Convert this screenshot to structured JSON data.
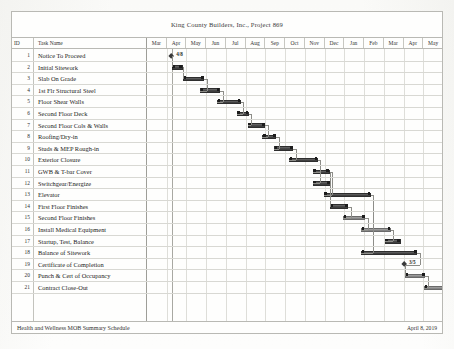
{
  "document": {
    "title": "King County Builders, Inc., Project 869",
    "footer_left": "Health and Wellness MOB Summary Schedule",
    "footer_right": "April 8, 2019"
  },
  "columns": {
    "id_header": "ID",
    "task_header": "Task Name"
  },
  "timeline": {
    "months": [
      "Mar",
      "Apr",
      "May",
      "Jun",
      "Jul",
      "Aug",
      "Sep",
      "Oct",
      "Nov",
      "Dec",
      "Jan",
      "Feb",
      "Mar",
      "Apr",
      "May"
    ]
  },
  "chart_data": {
    "type": "bar",
    "title": "King County Builders, Inc., Project 869",
    "xlabel": "",
    "ylabel": "",
    "orientation": "horizontal-gantt",
    "grid": true,
    "legend_position": "none",
    "x_axis_months": [
      "Mar",
      "Apr",
      "May",
      "Jun",
      "Jul",
      "Aug",
      "Sep",
      "Oct",
      "Nov",
      "Dec",
      "Jan",
      "Feb",
      "Mar",
      "Apr",
      "May"
    ],
    "month_count": 15,
    "status_line_month_index": 1.25,
    "categories": [
      "Notice To Proceed",
      "Initial Sitework",
      "Slab On Grade",
      "1st Flr Structural Steel",
      "Floor Shear Walls",
      "Second Floor Deck",
      "Second Floor Cols & Walls",
      "Roofing/Dry-in",
      "Studs & MEP Rough-in",
      "Exterior Closure",
      "GWB & T-bar Cover",
      "Switchgear/Energize",
      "Elevator",
      "First Floor Finishes",
      "Second Floor Finishes",
      "Install Medical Equipment",
      "Startup, Test, Balance",
      "Balance of Sitework",
      "Certificate of Completion",
      "Punch & Cert of Occupancy",
      "Contract Close-Out"
    ],
    "tasks": [
      {
        "id": 1,
        "name": "Notice To Proceed",
        "start_month": 1.25,
        "duration_months": 0.0,
        "type": "milestone",
        "label": "4/8",
        "shade": "dark"
      },
      {
        "id": 2,
        "name": "Initial Sitework",
        "start_month": 1.25,
        "duration_months": 0.55,
        "type": "bar",
        "shade": "dark"
      },
      {
        "id": 3,
        "name": "Slab On Grade",
        "start_month": 1.8,
        "duration_months": 1.1,
        "type": "bar",
        "shade": "dark"
      },
      {
        "id": 4,
        "name": "1st Flr Structural Steel",
        "start_month": 2.7,
        "duration_months": 1.0,
        "type": "bar",
        "shade": "dark"
      },
      {
        "id": 5,
        "name": "Floor Shear Walls",
        "start_month": 3.55,
        "duration_months": 1.2,
        "type": "bar",
        "shade": "dark"
      },
      {
        "id": 6,
        "name": "Second Floor Deck",
        "start_month": 4.55,
        "duration_months": 0.6,
        "type": "bar",
        "shade": "dark"
      },
      {
        "id": 7,
        "name": "Second Floor Cols & Walls",
        "start_month": 5.1,
        "duration_months": 0.9,
        "type": "bar",
        "shade": "dark"
      },
      {
        "id": 8,
        "name": "Roofing/Dry-in",
        "start_month": 5.85,
        "duration_months": 0.7,
        "type": "bar",
        "shade": "dark"
      },
      {
        "id": 9,
        "name": "Studs & MEP Rough-in",
        "start_month": 6.45,
        "duration_months": 0.95,
        "type": "bar",
        "shade": "dark"
      },
      {
        "id": 10,
        "name": "Exterior Closure",
        "start_month": 7.2,
        "duration_months": 1.45,
        "type": "bar",
        "shade": "dark"
      },
      {
        "id": 11,
        "name": "GWB & T-bar Cover",
        "start_month": 8.4,
        "duration_months": 0.85,
        "type": "bar",
        "shade": "dark"
      },
      {
        "id": 12,
        "name": "Switchgear/Energize",
        "start_month": 8.4,
        "duration_months": 0.9,
        "type": "bar",
        "shade": "dark"
      },
      {
        "id": 13,
        "name": "Elevator",
        "start_month": 8.95,
        "duration_months": 2.4,
        "type": "bar",
        "shade": "dark"
      },
      {
        "id": 14,
        "name": "First Floor Finishes",
        "start_month": 9.25,
        "duration_months": 0.95,
        "type": "bar",
        "shade": "dark"
      },
      {
        "id": 15,
        "name": "Second Floor Finishes",
        "start_month": 9.95,
        "duration_months": 1.1,
        "type": "bar",
        "shade": "light"
      },
      {
        "id": 16,
        "name": "Install Medical Equipment",
        "start_month": 10.85,
        "duration_months": 1.5,
        "type": "bar",
        "shade": "light"
      },
      {
        "id": 17,
        "name": "Startup, Test, Balance",
        "start_month": 12.05,
        "duration_months": 0.8,
        "type": "bar",
        "shade": "dark"
      },
      {
        "id": 18,
        "name": "Balance of Sitework",
        "start_month": 10.85,
        "duration_months": 2.85,
        "type": "bar",
        "shade": "dark"
      },
      {
        "id": 19,
        "name": "Certificate of Completion",
        "start_month": 13.05,
        "duration_months": 0.0,
        "type": "milestone",
        "label": "3/5",
        "shade": "dark"
      },
      {
        "id": 20,
        "name": "Punch & Cert of Occupancy",
        "start_month": 13.05,
        "duration_months": 1.05,
        "type": "bar",
        "shade": "light"
      },
      {
        "id": 21,
        "name": "Contract Close-Out",
        "start_month": 14.05,
        "duration_months": 1.3,
        "type": "bar",
        "shade": "light"
      }
    ]
  }
}
